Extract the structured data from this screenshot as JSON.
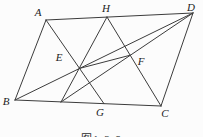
{
  "figure": {
    "caption": "图1-3-9",
    "background": "#fcfcfc",
    "stroke_color": "#3c3c3c",
    "label_color": "#1c1c1c",
    "width": 203,
    "height": 137,
    "points": [
      {
        "name": "A",
        "label": "A",
        "lx": 38,
        "ly": 16
      },
      {
        "name": "H",
        "label": "H",
        "lx": 106,
        "ly": 12
      },
      {
        "name": "D",
        "label": "D",
        "lx": 191,
        "ly": 11
      },
      {
        "name": "B",
        "label": "B",
        "lx": 6,
        "ly": 105
      },
      {
        "name": "G",
        "label": "G",
        "lx": 100,
        "ly": 116
      },
      {
        "name": "C",
        "label": "C",
        "lx": 165,
        "ly": 117
      },
      {
        "name": "E",
        "label": "E",
        "lx": 59,
        "ly": 61
      },
      {
        "name": "F",
        "label": "F",
        "lx": 141,
        "ly": 65
      }
    ],
    "segments": [
      {
        "name": "side-AB",
        "x1": 46,
        "y1": 20,
        "x2": 15,
        "y2": 100
      },
      {
        "name": "side-BC",
        "x1": 15,
        "y1": 100,
        "x2": 161,
        "y2": 106
      },
      {
        "name": "side-CD",
        "x1": 161,
        "y1": 106,
        "x2": 193,
        "y2": 13
      },
      {
        "name": "side-DA",
        "x1": 193,
        "y1": 13,
        "x2": 46,
        "y2": 20
      },
      {
        "name": "diagonal-BD",
        "x1": 15,
        "y1": 100,
        "x2": 193,
        "y2": 13
      },
      {
        "name": "line-A-G",
        "x1": 46,
        "y1": 20,
        "x2": 104,
        "y2": 103.7
      },
      {
        "name": "line-H-G1",
        "x1": 107,
        "y1": 17,
        "x2": 61,
        "y2": 102
      },
      {
        "name": "line-D-G1",
        "x1": 193,
        "y1": 13,
        "x2": 61,
        "y2": 102
      },
      {
        "name": "line-H-C",
        "x1": 107,
        "y1": 17,
        "x2": 161,
        "y2": 106
      },
      {
        "name": "segment-EF",
        "x1": 79.6,
        "y1": 68.4,
        "x2": 130.2,
        "y2": 55.2
      }
    ]
  }
}
